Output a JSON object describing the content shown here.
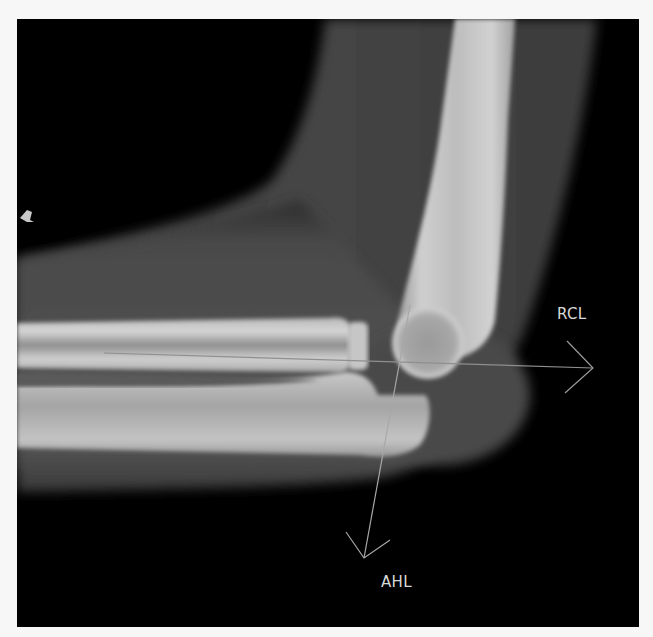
{
  "image": {
    "description": "Lateral elbow radiograph with two reference lines",
    "background_color": "#000000",
    "border_color": "#f7f7f7"
  },
  "annotations": {
    "rcl": {
      "label": "RCL",
      "line_start": [
        104,
        353
      ],
      "line_end": [
        593,
        368
      ],
      "color": "#9a9a9a"
    },
    "ahl": {
      "label": "AHL",
      "line_start": [
        410,
        305
      ],
      "line_end": [
        364,
        558
      ],
      "color": "#b0b0b0"
    }
  },
  "marker": {
    "label": "orientation-marker"
  }
}
